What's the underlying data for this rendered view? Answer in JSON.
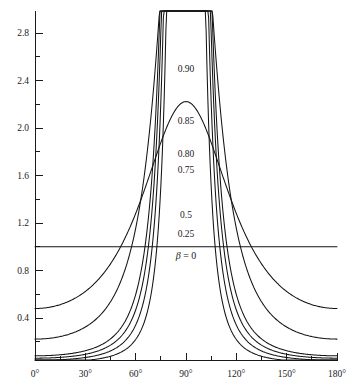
{
  "chart_data": {
    "type": "line",
    "title": "",
    "subtitle": "",
    "xlabel": "",
    "ylabel": "",
    "xlim": [
      0,
      180
    ],
    "ylim": [
      0.046,
      2.95
    ],
    "grid": false,
    "legend_position": "inline-annotations",
    "x_unit": "degrees",
    "x_ticks_major": [
      "0°",
      "30°",
      "60°",
      "90°",
      "120°",
      "150°",
      "180°"
    ],
    "x_tick_values": [
      0,
      30,
      60,
      90,
      120,
      150,
      180
    ],
    "x_minor_interval": 15,
    "y_ticks_major": [
      "0.4",
      "0.8",
      "1.2",
      "1.6",
      "2.0",
      "2.4",
      "2.8"
    ],
    "y_tick_values": [
      0.4,
      0.8,
      1.2,
      1.6,
      2.0,
      2.4,
      2.8
    ],
    "y_minor_interval": 0.2,
    "series": [
      {
        "name": "β = 0",
        "label": "β = 0",
        "beta": 0,
        "label_x": 90,
        "label_y": 0.9,
        "values": [
          1.0,
          1.0,
          1.0,
          1.0,
          1.0,
          1.0,
          1.0,
          1.0,
          1.0,
          1.0,
          1.0,
          1.0,
          1.0
        ]
      },
      {
        "name": "0.25",
        "label": "0.25",
        "beta": 0.25,
        "label_x": 90,
        "label_y": 1.085,
        "values": [
          0.945,
          0.952,
          0.968,
          0.992,
          1.018,
          1.042,
          1.058,
          1.042,
          1.018,
          0.992,
          0.968,
          0.952,
          0.945
        ]
      },
      {
        "name": "0.5",
        "label": "0.5",
        "beta": 0.5,
        "label_x": 90,
        "label_y": 1.245,
        "values": [
          0.755,
          0.783,
          0.852,
          0.948,
          1.055,
          1.152,
          1.195,
          1.152,
          1.055,
          0.948,
          0.852,
          0.783,
          0.755
        ]
      },
      {
        "name": "0.75",
        "label": "0.75",
        "beta": 0.75,
        "label_x": 90,
        "label_y": 1.625,
        "values": [
          0.345,
          0.368,
          0.44,
          0.57,
          0.79,
          1.155,
          1.525,
          1.155,
          0.79,
          0.57,
          0.44,
          0.368,
          0.345
        ]
      },
      {
        "name": "0.80",
        "label": "0.80",
        "beta": 0.8,
        "label_x": 90,
        "label_y": 1.76,
        "values": [
          0.27,
          0.289,
          0.35,
          0.465,
          0.685,
          1.095,
          1.645,
          1.095,
          0.685,
          0.465,
          0.35,
          0.289,
          0.27
        ]
      },
      {
        "name": "0.85",
        "label": "0.85",
        "beta": 0.85,
        "label_x": 90,
        "label_y": 2.035,
        "values": [
          0.198,
          0.213,
          0.262,
          0.358,
          0.56,
          1.005,
          1.9,
          1.005,
          0.56,
          0.358,
          0.262,
          0.213,
          0.198
        ]
      },
      {
        "name": "0.90",
        "label": "0.90",
        "beta": 0.9,
        "label_x": 90,
        "label_y": 2.475,
        "values": [
          0.128,
          0.139,
          0.175,
          0.248,
          0.412,
          0.86,
          2.29,
          0.86,
          0.412,
          0.248,
          0.175,
          0.139,
          0.128
        ]
      }
    ]
  },
  "axes": {
    "y_labels": [
      "2.8",
      "2.4",
      "2.0",
      "1.6",
      "1.2",
      "0.8",
      "0.4"
    ],
    "x_labels": [
      "0°",
      "30°",
      "60°",
      "90°",
      "120°",
      "150°",
      "180°"
    ]
  },
  "annotations": {
    "beta_zero_prefix": "β",
    "beta_zero_suffix": " = 0",
    "labels": [
      "0.90",
      "0.85",
      "0.80",
      "0.75",
      "0.5",
      "0.25"
    ]
  },
  "colors": {
    "curve": "#141414",
    "axis": "#1a1a1a",
    "background": "#ffffff",
    "text": "#1a1a1a"
  }
}
